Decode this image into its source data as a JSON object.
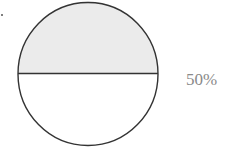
{
  "figure": {
    "type": "fraction-circle",
    "shaded_fraction": 0.5,
    "label": "50%",
    "colors": {
      "stroke": "#333333",
      "shaded_fill": "#ebebeb",
      "unshaded_fill": "#ffffff",
      "label": "#8a8a8a"
    }
  }
}
